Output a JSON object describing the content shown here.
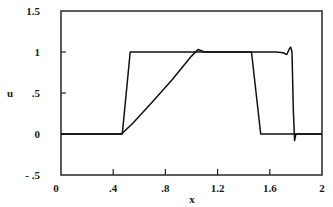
{
  "chart_data": {
    "type": "line",
    "title": "",
    "xlabel": "x",
    "ylabel": "u",
    "xlim": [
      0,
      2
    ],
    "ylim": [
      -0.5,
      1.5
    ],
    "grid": false,
    "legend": null,
    "x_ticks": [
      {
        "value": 0,
        "label": "0"
      },
      {
        "value": 0.4,
        "label": ".4"
      },
      {
        "value": 0.8,
        "label": ".8"
      },
      {
        "value": 1.2,
        "label": "1.2"
      },
      {
        "value": 1.6,
        "label": "1.6"
      },
      {
        "value": 2,
        "label": "2"
      }
    ],
    "y_ticks": [
      {
        "value": 1.5,
        "label": "1.5"
      },
      {
        "value": 1,
        "label": "1"
      },
      {
        "value": 0.5,
        "label": ".5"
      },
      {
        "value": 0,
        "label": "0"
      },
      {
        "value": -0.5,
        "label": "- .5"
      }
    ],
    "series": [
      {
        "name": "steep profile",
        "x": [
          0,
          0.47,
          0.53,
          1.46,
          1.53,
          2.0
        ],
        "y": [
          0,
          0,
          1,
          1,
          0,
          0
        ]
      },
      {
        "name": "ramp profile",
        "x": [
          0,
          0.45,
          0.47,
          0.55,
          0.7,
          0.85,
          1.0,
          1.05,
          1.1,
          1.3,
          1.5,
          1.65,
          1.7,
          1.73,
          1.75,
          1.76,
          1.77,
          1.78,
          1.79,
          1.8,
          2.0
        ],
        "y": [
          0,
          0,
          0.01,
          0.13,
          0.39,
          0.66,
          0.95,
          1.03,
          1.0,
          1.0,
          1.0,
          1.0,
          0.99,
          0.97,
          1.04,
          1.06,
          1.0,
          0.3,
          -0.08,
          0,
          0
        ]
      }
    ]
  }
}
